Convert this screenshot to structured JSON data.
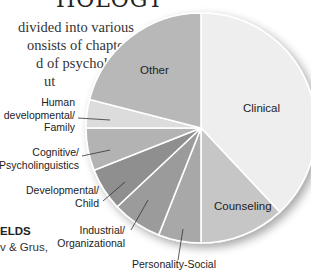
{
  "page": {
    "heading": "HOLOGY",
    "body_lines": [
      "divided into various",
      "onsists of chapters",
      "d of psychology",
      "ut"
    ],
    "section_head": "ELDS",
    "section_sub": "v & Grus,"
  },
  "chart_data": {
    "type": "pie",
    "title": "",
    "start_angle_deg": 0,
    "direction": "clockwise",
    "categories": [
      "Clinical",
      "Counseling",
      "Personality-Social",
      "Industrial/ Organizational",
      "Developmental/ Child",
      "Cognitive/ Psycholinguistics",
      "Human developmental/ Family",
      "Other"
    ],
    "values": [
      38,
      12,
      6,
      7,
      6,
      6,
      4,
      21
    ],
    "units": "percent (estimated)",
    "colors": [
      "#eeeeee",
      "#c6c6c6",
      "#a8a8a8",
      "#9b9b9b",
      "#8f8f8f",
      "#b3b3b3",
      "#dcdcdc",
      "#b8b8b8"
    ],
    "labels": {
      "clinical": "Clinical",
      "counseling": "Counseling",
      "personality": "Personality-Social",
      "industrial": [
        "Industrial/",
        "Organizational"
      ],
      "developmental": [
        "Developmental/",
        "Child"
      ],
      "cognitive": [
        "Cognitive/",
        "Psycholinguistics"
      ],
      "human": [
        "Human",
        "developmental/",
        "Family"
      ],
      "other": "Other"
    },
    "legend": "none (labels on/beside slices)"
  }
}
